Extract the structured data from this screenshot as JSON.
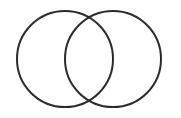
{
  "diagram": {
    "type": "venn",
    "background": "#ffffff",
    "stroke_color": "#2b2b2b",
    "stroke_width": 2,
    "circles": [
      {
        "id": "left",
        "cx": 65,
        "cy": 59,
        "r": 48
      },
      {
        "id": "right",
        "cx": 113,
        "cy": 59,
        "r": 48
      }
    ]
  }
}
